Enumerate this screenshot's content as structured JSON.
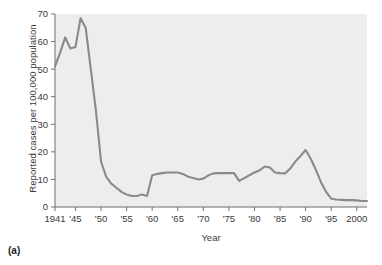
{
  "figure": {
    "panel_letter": "(a)",
    "background_color": "#ffffff",
    "plot_background_color": "#ededed",
    "line_color": "#8a8a8a",
    "axis_color": "#6e6e6e"
  },
  "chart_data": {
    "type": "line",
    "title": "",
    "xlabel": "Year",
    "ylabel": "Reported cases per 100,000 population",
    "xlim": [
      1941,
      2002
    ],
    "ylim": [
      0,
      70
    ],
    "grid": false,
    "legend": null,
    "y_ticks": [
      0,
      10,
      20,
      30,
      40,
      50,
      60,
      70
    ],
    "y_tick_labels": [
      "0",
      "10",
      "20",
      "30",
      "40",
      "50",
      "60",
      "70"
    ],
    "x_ticks": [
      1941,
      1945,
      1950,
      1955,
      1960,
      1965,
      1970,
      1975,
      1980,
      1985,
      1990,
      1995,
      2000
    ],
    "x_tick_labels": [
      "1941",
      "'45",
      "'50",
      "'55",
      "'60",
      "'65",
      "'70",
      "'75",
      "'80",
      "'85",
      "'90",
      "'95",
      "2000"
    ],
    "series": [
      {
        "name": "Reported cases per 100,000 population",
        "color": "#8a8a8a",
        "x": [
          1941,
          1942,
          1943,
          1944,
          1945,
          1946,
          1947,
          1948,
          1949,
          1950,
          1951,
          1952,
          1953,
          1954,
          1955,
          1956,
          1957,
          1958,
          1959,
          1960,
          1961,
          1962,
          1963,
          1964,
          1965,
          1966,
          1967,
          1968,
          1969,
          1970,
          1971,
          1972,
          1973,
          1974,
          1975,
          1976,
          1977,
          1978,
          1979,
          1980,
          1981,
          1982,
          1983,
          1984,
          1985,
          1986,
          1987,
          1988,
          1989,
          1990,
          1991,
          1992,
          1993,
          1994,
          1995,
          1996,
          1997,
          1998,
          1999,
          2000,
          2001,
          2002
        ],
        "y": [
          51,
          56,
          61.5,
          57.5,
          58,
          68.5,
          65,
          50,
          35,
          16.5,
          11,
          8.5,
          7,
          5.5,
          4.5,
          4,
          4,
          4.5,
          4,
          11.5,
          12,
          12.3,
          12.5,
          12.5,
          12.5,
          12,
          11,
          10.5,
          10,
          10.3,
          11.5,
          12.2,
          12.3,
          12.3,
          12.3,
          12.3,
          9.5,
          10.5,
          11.5,
          12.5,
          13.3,
          14.7,
          14.3,
          12.5,
          12.3,
          12.2,
          14,
          16.5,
          18.5,
          20.7,
          17.5,
          13.5,
          9,
          5.5,
          3,
          2.7,
          2.6,
          2.5,
          2.5,
          2.4,
          2.2,
          2.2
        ]
      }
    ]
  }
}
